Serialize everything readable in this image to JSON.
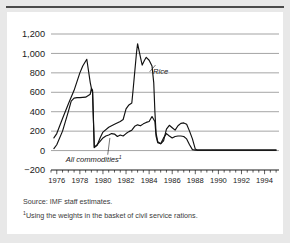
{
  "figure": {
    "source_note": "Source: IMF staff estimates.",
    "footnote_marker": "1",
    "footnote": "Using the weights in the basket of civil service rations."
  },
  "chart_data": {
    "type": "line",
    "title": "",
    "xlabel": "",
    "ylabel": "",
    "xlim": [
      1975.5,
      1995.25
    ],
    "ylim": [
      -200,
      1200
    ],
    "grid": true,
    "grid_axis": "y",
    "legend_position": "inline-annotations",
    "y_ticks": [
      -200,
      0,
      200,
      400,
      600,
      800,
      1000,
      1200
    ],
    "y_tick_labels": [
      "−200",
      "0",
      "200",
      "400",
      "600",
      "800",
      "1,000",
      "1,200"
    ],
    "x_ticks": [
      1976,
      1978,
      1980,
      1982,
      1984,
      1986,
      1988,
      1990,
      1992,
      1994
    ],
    "x_tick_labels": [
      "1976",
      "1978",
      "1980",
      "1982",
      "1984",
      "1986",
      "1988",
      "1990",
      "1992",
      "1994"
    ],
    "x_minor_tick_interval": 0.5,
    "annotations": [
      {
        "text": "Rice",
        "x": 1985.0,
        "y": 790,
        "style": "italic"
      },
      {
        "text": "All commodities",
        "x": 1979.2,
        "y": -115,
        "style": "italic",
        "superscript": "1"
      }
    ],
    "series": [
      {
        "name": "Rice",
        "color": "#111111",
        "x": [
          1975.75,
          1976.0,
          1976.5,
          1977.0,
          1977.5,
          1978.0,
          1978.25,
          1978.6,
          1978.9,
          1979.0,
          1979.1,
          1979.25,
          1979.5,
          1979.75,
          1980.0,
          1980.5,
          1981.0,
          1981.5,
          1981.75,
          1982.0,
          1982.25,
          1982.5,
          1982.6,
          1982.9,
          1983.0,
          1983.25,
          1983.4,
          1983.6,
          1983.75,
          1984.0,
          1984.25,
          1984.4,
          1984.5,
          1984.6,
          1984.75,
          1985.0,
          1985.25,
          1985.5,
          1985.75,
          1986.0,
          1986.25,
          1986.5,
          1986.75,
          1987.0,
          1987.25,
          1987.5,
          1987.75,
          1988.0,
          1988.15,
          1988.5,
          1990.0,
          1992.0,
          1995.0
        ],
        "y": [
          130,
          175,
          330,
          480,
          620,
          800,
          870,
          940,
          700,
          640,
          620,
          30,
          55,
          130,
          190,
          240,
          270,
          300,
          320,
          430,
          470,
          490,
          610,
          1000,
          1100,
          960,
          880,
          930,
          960,
          930,
          870,
          700,
          400,
          180,
          90,
          70,
          100,
          220,
          260,
          235,
          210,
          255,
          280,
          285,
          270,
          200,
          120,
          15,
          5,
          5,
          5,
          5,
          5
        ]
      },
      {
        "name": "All commodities",
        "color": "#111111",
        "x": [
          1975.75,
          1976.0,
          1976.5,
          1977.0,
          1977.25,
          1977.5,
          1977.75,
          1978.0,
          1978.5,
          1978.9,
          1979.0,
          1979.1,
          1979.25,
          1979.5,
          1979.75,
          1980.0,
          1980.25,
          1980.5,
          1980.75,
          1981.0,
          1981.25,
          1981.5,
          1981.75,
          1982.0,
          1982.25,
          1982.5,
          1982.75,
          1983.0,
          1983.25,
          1983.5,
          1983.75,
          1984.0,
          1984.25,
          1984.5,
          1984.6,
          1984.75,
          1985.0,
          1985.25,
          1985.5,
          1985.75,
          1986.0,
          1986.25,
          1986.5,
          1986.75,
          1987.0,
          1987.25,
          1987.5,
          1987.75,
          1988.0,
          1988.15,
          1988.5,
          1990.0,
          1992.0,
          1995.0
        ],
        "y": [
          20,
          60,
          200,
          400,
          510,
          540,
          545,
          545,
          550,
          580,
          640,
          600,
          35,
          60,
          95,
          130,
          150,
          160,
          175,
          170,
          145,
          160,
          150,
          175,
          195,
          210,
          250,
          265,
          255,
          275,
          290,
          300,
          350,
          300,
          150,
          80,
          70,
          130,
          175,
          150,
          130,
          145,
          150,
          150,
          145,
          120,
          60,
          10,
          5,
          5,
          5,
          5,
          5,
          5
        ]
      }
    ]
  }
}
